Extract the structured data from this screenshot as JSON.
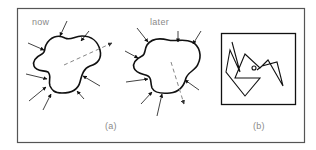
{
  "figure": {
    "panel_a": {
      "caption": "(a)",
      "left_title": "now",
      "right_title": "later"
    },
    "panel_b": {
      "caption": "(b)"
    }
  },
  "colors": {
    "ink": "#1a1a1a",
    "frame": "#555555",
    "label": "#8a8a8a",
    "dashed": "#777777"
  }
}
